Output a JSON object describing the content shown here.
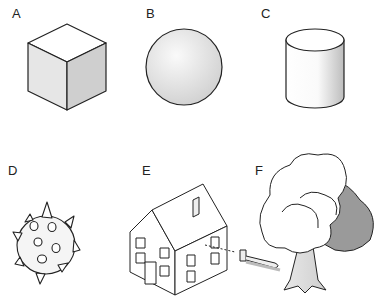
{
  "figure": {
    "panels": [
      {
        "label": "A",
        "shape": "cube"
      },
      {
        "label": "B",
        "shape": "sphere"
      },
      {
        "label": "C",
        "shape": "cylinder"
      },
      {
        "label": "D",
        "shape": "spiky-ball"
      },
      {
        "label": "E",
        "shape": "house"
      },
      {
        "label": "F",
        "shape": "tree"
      }
    ],
    "colors": {
      "stroke": "#222222",
      "light_fill": "#eeeeee",
      "mid_fill": "#d6d6d6",
      "dark_fill": "#9a9a9a",
      "background": "#ffffff"
    }
  }
}
